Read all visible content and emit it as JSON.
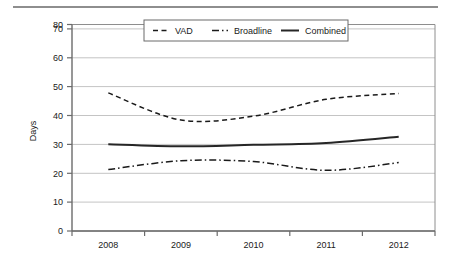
{
  "chart_data": {
    "type": "line",
    "title": "",
    "subtitle": "",
    "xlabel": "",
    "ylabel": "Days",
    "x": [
      "2008",
      "2009",
      "2010",
      "2011",
      "2012"
    ],
    "categories": [
      "2008",
      "2009",
      "2010",
      "2011",
      "2012"
    ],
    "xtick_labels": [
      "2008",
      "2009",
      "2010",
      "2011",
      "2012"
    ],
    "ytick_labels": [
      "0",
      "10",
      "20",
      "30",
      "40",
      "50",
      "60",
      "70",
      "80"
    ],
    "ytick_values": [
      0,
      10,
      20,
      30,
      40,
      50,
      60,
      70,
      80
    ],
    "ylim": [
      0,
      80
    ],
    "grid": "horizontal",
    "legend_position": "top-center",
    "series": [
      {
        "name": "VAD",
        "style": "dashed",
        "color": "#1a1a1a",
        "values": [
          53.5,
          43.0,
          44.5,
          51.0,
          53.3
        ]
      },
      {
        "name": "Broadline",
        "style": "dash-dot",
        "color": "#1a1a1a",
        "values": [
          23.8,
          27.2,
          26.9,
          23.5,
          26.5
        ]
      },
      {
        "name": "Combined",
        "style": "solid",
        "color": "#262626",
        "values": [
          33.6,
          32.8,
          33.4,
          34.1,
          36.5
        ]
      }
    ]
  },
  "legend": {
    "items": [
      {
        "label": "VAD",
        "style": "dashed"
      },
      {
        "label": "Broadline",
        "style": "dash-dot"
      },
      {
        "label": "Combined",
        "style": "solid"
      }
    ]
  },
  "axes": {
    "y_title": "Days"
  }
}
